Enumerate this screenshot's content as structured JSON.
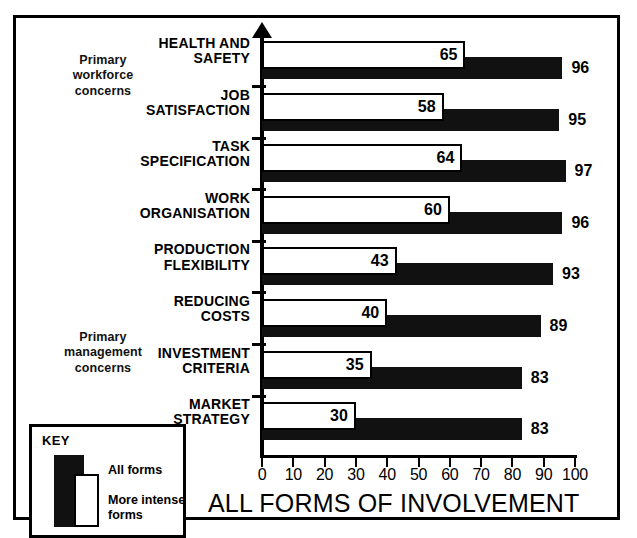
{
  "chart_data": {
    "type": "bar",
    "title": "ALL FORMS OF INVOLVEMENT",
    "xlabel": "",
    "ylabel": "",
    "xlim": [
      0,
      100
    ],
    "xticks": [
      0,
      10,
      20,
      30,
      40,
      50,
      60,
      70,
      80,
      90,
      100
    ],
    "grid": false,
    "orientation": "horizontal",
    "legend_position": "bottom-left",
    "categories": [
      "HEALTH AND SAFETY",
      "JOB SATISFACTION",
      "TASK SPECIFICATION",
      "WORK ORGANISATION",
      "PRODUCTION FLEXIBILITY",
      "REDUCING COSTS",
      "INVESTMENT CRITERIA",
      "MARKET STRATEGY"
    ],
    "category_lines": [
      [
        "HEALTH AND",
        "SAFETY"
      ],
      [
        "JOB",
        "SATISFACTION"
      ],
      [
        "TASK",
        "SPECIFICATION"
      ],
      [
        "WORK",
        "ORGANISATION"
      ],
      [
        "PRODUCTION",
        "FLEXIBILITY"
      ],
      [
        "REDUCING",
        "COSTS"
      ],
      [
        "INVESTMENT",
        "CRITERIA"
      ],
      [
        "MARKET",
        "STRATEGY"
      ]
    ],
    "series": [
      {
        "name": "All forms",
        "color": "#111111",
        "values": [
          96,
          95,
          97,
          96,
          93,
          89,
          83,
          83
        ]
      },
      {
        "name": "More intense forms",
        "color": "#ffffff",
        "values": [
          65,
          58,
          64,
          60,
          43,
          40,
          35,
          30
        ]
      }
    ]
  },
  "annotations": {
    "workforce_note": "Primary\nworkforce\nconcerns",
    "workforce_note_lines": [
      "Primary",
      "workforce",
      "concerns"
    ],
    "management_note": "Primary\nmanagement\nconcerns",
    "management_note_lines": [
      "Primary",
      "management",
      "concerns"
    ]
  },
  "key": {
    "title": "KEY",
    "all_forms_label": "All forms",
    "more_intense_label": "More intense forms",
    "more_intense_line1": "More intense",
    "more_intense_line2": "forms"
  }
}
